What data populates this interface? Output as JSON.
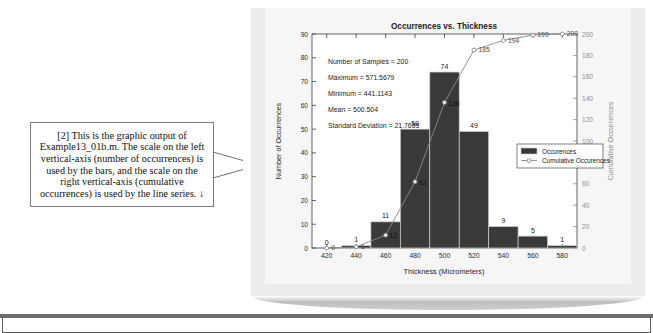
{
  "callout": {
    "name": "figure-callout-note",
    "text": "[2] This is the graphic output of Example13_01b.m.  The scale on the left vertical-axis (number of occurrences) is used by the bars, and the scale on the right vertical-axis (cumulative occurrences) is used by the line series.  ↓"
  },
  "chart_data": {
    "type": "bar",
    "title": "Occurrences vs. Thickness",
    "xlabel": "Thickness (Micrometers)",
    "ylabel": "Number of Occurrences",
    "y2label": "Cumulative Occurrences",
    "categories": [
      420,
      440,
      460,
      480,
      500,
      520,
      540,
      560,
      580
    ],
    "xlim": [
      410,
      590
    ],
    "xticks": [
      420,
      440,
      460,
      480,
      500,
      520,
      540,
      560,
      580
    ],
    "ylim": [
      0,
      90
    ],
    "yticks": [
      0,
      10,
      20,
      30,
      40,
      50,
      60,
      70,
      80,
      90
    ],
    "y2lim": [
      0,
      200
    ],
    "y2ticks": [
      0,
      20,
      40,
      60,
      80,
      100,
      120,
      140,
      160,
      180,
      200
    ],
    "grid": false,
    "legend_position": "center-right",
    "series": [
      {
        "name": "Occurences",
        "type": "bar",
        "axis": "left",
        "color": "#3a3a3a",
        "values": [
          0,
          1,
          11,
          50,
          74,
          49,
          9,
          5,
          1
        ],
        "labels": [
          "0",
          "1",
          "11",
          "50",
          "74",
          "49",
          "9",
          "5",
          "1"
        ]
      },
      {
        "name": "Cumulative Occurences",
        "type": "line",
        "axis": "right",
        "color": "#8a8a8a",
        "marker": "circle",
        "values": [
          0,
          1,
          12,
          62,
          136,
          185,
          194,
          199,
          200
        ],
        "labels": [
          "0",
          "1",
          "12",
          "62",
          "136",
          "185",
          "194",
          "199",
          "200"
        ]
      }
    ],
    "annotations": [
      "Number of Samples = 200",
      "Maximum = 571.5679",
      "Minimum = 441.1143",
      "Mean = 500.504",
      "Standard Deviation = 21.7655"
    ]
  }
}
